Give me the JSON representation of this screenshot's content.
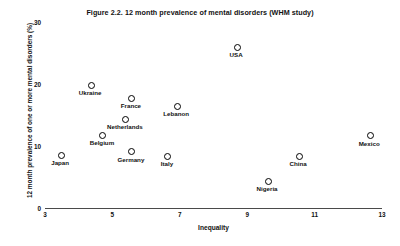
{
  "chart_data": {
    "type": "scatter",
    "title": "Figure 2.2. 12 month prevalence of mental disorders (WHM study)",
    "xlabel": "Inequality",
    "ylabel": "12 month prevalence of one or more mental disorders (%)",
    "xlim": [
      3,
      13
    ],
    "ylim": [
      0,
      30
    ],
    "xticks": [
      3,
      5,
      7,
      9,
      11,
      13
    ],
    "yticks": [
      0,
      10,
      20,
      30
    ],
    "xtick_labels": [
      "3",
      "5",
      "7",
      "9",
      "11",
      "13"
    ],
    "ytick_labels": [
      "0",
      "10",
      "20",
      "30"
    ],
    "grid": false,
    "legend": "none",
    "marker": "open-circle",
    "points": [
      {
        "label": "Japan",
        "x": 3.45,
        "y": 8.7
      },
      {
        "label": "Ukraine",
        "x": 4.34,
        "y": 20.0
      },
      {
        "label": "Belgium",
        "x": 4.69,
        "y": 11.9
      },
      {
        "label": "Germany",
        "x": 5.55,
        "y": 9.2
      },
      {
        "label": "Netherlands",
        "x": 5.37,
        "y": 14.5
      },
      {
        "label": "France",
        "x": 5.55,
        "y": 17.9
      },
      {
        "label": "Italy",
        "x": 6.62,
        "y": 8.5
      },
      {
        "label": "Lebanon",
        "x": 6.89,
        "y": 16.6
      },
      {
        "label": "USA",
        "x": 8.67,
        "y": 26.1
      },
      {
        "label": "Nigeria",
        "x": 9.59,
        "y": 4.5
      },
      {
        "label": "China",
        "x": 10.51,
        "y": 8.5
      },
      {
        "label": "Mexico",
        "x": 12.62,
        "y": 11.8
      }
    ]
  }
}
